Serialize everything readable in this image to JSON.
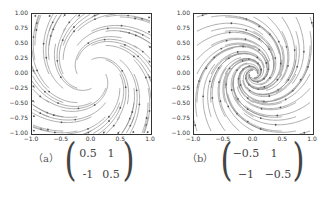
{
  "panels": [
    {
      "label": "（a）",
      "matrix": [
        [
          "0.5",
          "1"
        ],
        [
          "-1",
          "0.5"
        ]
      ],
      "rotation": "clockwise",
      "yticks": [
        "1.00",
        "0.75",
        "0.50",
        "0.25",
        "0.00",
        "−0.25",
        "−0.50",
        "−0.75",
        "−1.00"
      ],
      "xticks": [
        "−1.0",
        "−0.5",
        "0.0",
        "0.5",
        "1.0"
      ]
    },
    {
      "label": "（b）",
      "matrix": [
        [
          "−0.5",
          "1"
        ],
        [
          "−1",
          "−0.5"
        ]
      ],
      "rotation": "clockwise-inward",
      "yticks": [
        "1.00",
        "0.75",
        "0.50",
        "0.25",
        "0.00",
        "−0.25",
        "−0.50",
        "−0.75",
        "−1.00"
      ],
      "xticks": [
        "−1.0",
        "−0.5",
        "0.0",
        "0.5",
        "1.0"
      ]
    }
  ],
  "colors": {
    "stream": "#8a8a8a",
    "axis": "#333333",
    "text": "#444444"
  }
}
